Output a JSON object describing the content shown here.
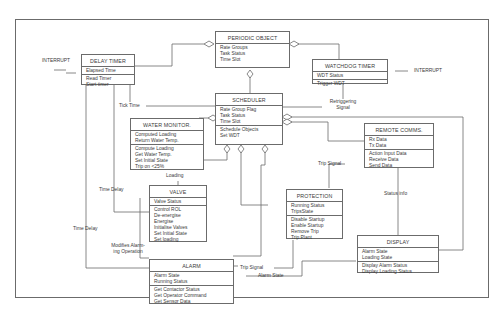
{
  "diagram": {
    "type": "object-oriented class/object diagram",
    "objects": {
      "periodic_object": {
        "name": "PERIODIC OBJECT",
        "attributes": [
          "Rate Groups",
          "Task Status",
          "Time Slot"
        ],
        "operations": []
      },
      "delay_timer": {
        "name": "DELAY TIMER",
        "attributes": [
          "Elapsed Time"
        ],
        "operations": [
          "Read Timer",
          "Start timer"
        ]
      },
      "watchdog_timer": {
        "name": "WATCHDOG TIMER",
        "attributes": [
          "WDT Status"
        ],
        "operations": [
          "Trigger WDT"
        ]
      },
      "scheduler": {
        "name": "SCHEDULER",
        "attributes": [
          "Rate Group Flag",
          "Task Status",
          "Time Slot"
        ],
        "operations": [
          "Schedule Objects",
          "Set WDT"
        ]
      },
      "water_monitor": {
        "name": "WATER MONITOR.",
        "attributes": [
          "Computed Loading",
          "Return Water Temp."
        ],
        "operations": [
          "Compute Loading",
          "Get Water Temp.",
          "Set Initial State",
          "Trip on <25%"
        ]
      },
      "remote_comms": {
        "name": "REMOTE COMMS.",
        "attributes": [
          "Rx Data",
          "Tx Data"
        ],
        "operations": [
          "Action Input Data",
          "Receive Data",
          "Send Data"
        ]
      },
      "valve": {
        "name": "VALVE",
        "attributes": [
          "Valve Status"
        ],
        "operations": [
          "Control ROL",
          "De-energise",
          "Energise",
          "Initialise Valves",
          "Set Initial State",
          "Set loading"
        ]
      },
      "protection": {
        "name": "PROTECTION",
        "attributes": [
          "Running Status",
          "TripsState"
        ],
        "operations": [
          "Disable Startup",
          "Enable Startup",
          "Remove Trip",
          "Trip Plant"
        ]
      },
      "display": {
        "name": "DISPLAY",
        "attributes": [
          "Alarm State",
          "Loading State"
        ],
        "operations": [
          "Display Alarm Status",
          "Display Loading Status"
        ]
      },
      "alarm": {
        "name": "ALARM",
        "attributes": [
          "Alarm State",
          "Running Status"
        ],
        "operations": [
          "Get Contactor Status",
          "Get Operator Command",
          "Get Sensor Data"
        ]
      }
    },
    "labels": {
      "interrupt_left": "INTERRUPT",
      "interrupt_right": "INTERRUPT",
      "tick_time": "Tick Time",
      "retriggering_signal_1": "Retriggering",
      "retriggering_signal_2": "Signal",
      "loading": "Loading",
      "time_delay_1": "Time Delay",
      "time_delay_2": "Time Delay",
      "modifies_alarm_1": "Modifies Alarm-",
      "modifies_alarm_2": "ing Operation",
      "trip_signal_1": "Trip Signal",
      "trip_signal_2": "Trip Signal",
      "status_info": "Status info",
      "alarm_state": "Alarm State"
    },
    "relationships": [
      {
        "from": "DELAY TIMER",
        "to": "PERIODIC OBJECT",
        "kind": "aggregation"
      },
      {
        "from": "WATCHDOG TIMER",
        "to": "PERIODIC OBJECT",
        "kind": "aggregation"
      },
      {
        "from": "SCHEDULER",
        "to": "PERIODIC OBJECT",
        "kind": "aggregation"
      },
      {
        "from": "DELAY TIMER",
        "to": "SCHEDULER",
        "label": "Tick Time"
      },
      {
        "from": "WATCHDOG TIMER",
        "to": "SCHEDULER",
        "label": "Retriggering Signal"
      },
      {
        "from": "WATER MONITOR.",
        "to": "SCHEDULER",
        "kind": "aggregation"
      },
      {
        "from": "REMOTE COMMS.",
        "to": "SCHEDULER",
        "kind": "aggregation"
      },
      {
        "from": "DISPLAY",
        "to": "SCHEDULER",
        "kind": "aggregation"
      },
      {
        "from": "VALVE",
        "to": "SCHEDULER",
        "kind": "aggregation"
      },
      {
        "from": "PROTECTION",
        "to": "SCHEDULER",
        "kind": "aggregation"
      },
      {
        "from": "ALARM",
        "to": "SCHEDULER",
        "kind": "aggregation"
      },
      {
        "from": "WATER MONITOR.",
        "to": "VALVE",
        "label": "Loading"
      },
      {
        "from": "DELAY TIMER",
        "to": "VALVE",
        "label": "Time Delay"
      },
      {
        "from": "DELAY TIMER",
        "to": "ALARM",
        "label": "Time Delay"
      },
      {
        "from": "WATER MONITOR.",
        "to": "ALARM",
        "label": "Modifies Alarming Operation"
      },
      {
        "from": "REMOTE COMMS.",
        "to": "PROTECTION",
        "label": "Trip Signal"
      },
      {
        "from": "PROTECTION",
        "to": "ALARM",
        "label": "Trip Signal"
      },
      {
        "from": "REMOTE COMMS.",
        "to": "DISPLAY",
        "label": "Status info"
      },
      {
        "from": "ALARM",
        "to": "DISPLAY",
        "label": "Alarm State"
      }
    ]
  },
  "colors": {
    "line": "#6b6b6b",
    "text": "#3a3a3a",
    "background": "#ffffff"
  }
}
